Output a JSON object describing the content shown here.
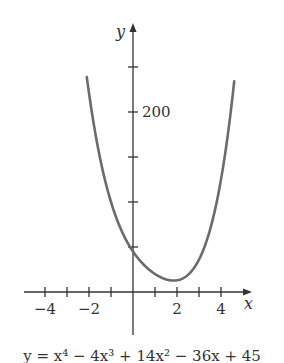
{
  "chart_data": {
    "type": "line",
    "title": "",
    "caption": "y = x⁴ − 4x³ + 14x² − 36x + 45",
    "xlabel": "x",
    "ylabel": "y",
    "x_ticks": [
      -4,
      -3,
      -2,
      -1,
      1,
      2,
      3,
      4
    ],
    "x_tick_labels": [
      {
        "value": -4,
        "label": "−4"
      },
      {
        "value": -2,
        "label": "−2"
      },
      {
        "value": 2,
        "label": "2"
      },
      {
        "value": 4,
        "label": "4"
      }
    ],
    "y_ticks": [
      50,
      100,
      150,
      200,
      250
    ],
    "y_tick_labels": [
      {
        "value": 200,
        "label": "200"
      }
    ],
    "xlim": [
      -5,
      5.3
    ],
    "ylim": [
      -40,
      260
    ],
    "grid": false,
    "series": [
      {
        "name": "y = x^4 - 4x^3 + 14x^2 - 36x + 45",
        "color": "#6b6b6b",
        "x": [
          -2.1,
          -2.0,
          -1.8,
          -1.5,
          -1.0,
          -0.5,
          0,
          0.5,
          1.0,
          1.5,
          2.0,
          2.5,
          3.0,
          3.5,
          4.0,
          4.5,
          4.6
        ],
        "y": [
          238.8,
          221,
          189,
          149.1,
          100,
          67.1,
          45,
          30.1,
          20,
          14.1,
          13,
          19.1,
          36,
          69.1,
          125,
          212,
          234
        ]
      }
    ],
    "axis_color": "#333333"
  },
  "mapping": {
    "origin_px": [
      133,
      292
    ],
    "px_per_x": 22,
    "px_per_y": 0.9
  }
}
